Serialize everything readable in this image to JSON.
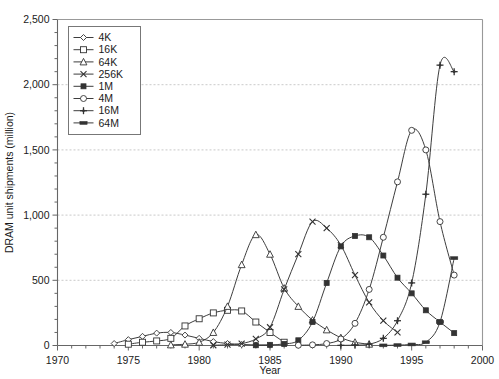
{
  "chart_data": {
    "type": "line",
    "title": "",
    "xlabel": "Year",
    "ylabel": "DRAM unit shipments (million)",
    "xlim": [
      1970,
      2000
    ],
    "ylim": [
      0,
      2500
    ],
    "xticks": [
      1970,
      1975,
      1980,
      1985,
      1990,
      1995,
      2000
    ],
    "xtick_labels": [
      "1970",
      "1975",
      "1980",
      "1985",
      "1990",
      "1995",
      "2000"
    ],
    "yticks": [
      0,
      500,
      1000,
      1500,
      2000,
      2500
    ],
    "ytick_labels": [
      "0",
      "500",
      "1,000",
      "1,500",
      "2,000",
      "2,500"
    ],
    "x_minor_step": 1,
    "y_minor_step": 100,
    "grid": "horizontal-major-dashed",
    "legend_position": "top-left-inside",
    "line_color": "#333333",
    "grid_color": "#bbbbbb",
    "axis_color": "#555555",
    "series": [
      {
        "name": "4K",
        "marker": "diamond-open",
        "x": [
          1974,
          1975,
          1976,
          1977,
          1978,
          1979,
          1980,
          1981,
          1982,
          1983,
          1984,
          1985
        ],
        "values": [
          15,
          45,
          70,
          95,
          100,
          80,
          55,
          30,
          15,
          8,
          4,
          2
        ]
      },
      {
        "name": "16K",
        "marker": "square-open",
        "x": [
          1975,
          1976,
          1977,
          1978,
          1979,
          1980,
          1981,
          1982,
          1983,
          1984,
          1985,
          1986
        ],
        "values": [
          10,
          25,
          35,
          55,
          150,
          205,
          250,
          270,
          265,
          180,
          100,
          25
        ]
      },
      {
        "name": "64K",
        "marker": "triangle-open",
        "x": [
          1978,
          1979,
          1980,
          1981,
          1982,
          1983,
          1984,
          1985,
          1986,
          1987,
          1988,
          1989,
          1990,
          1991,
          1992
        ],
        "values": [
          5,
          10,
          25,
          100,
          300,
          620,
          850,
          700,
          440,
          300,
          195,
          120,
          60,
          25,
          10
        ]
      },
      {
        "name": "256K",
        "marker": "x",
        "x": [
          1981,
          1982,
          1983,
          1984,
          1985,
          1986,
          1987,
          1988,
          1989,
          1990,
          1991,
          1992,
          1993,
          1994
        ],
        "values": [
          2,
          6,
          15,
          50,
          140,
          430,
          700,
          950,
          900,
          770,
          540,
          330,
          190,
          100
        ]
      },
      {
        "name": "1M",
        "marker": "square-filled",
        "x": [
          1984,
          1985,
          1986,
          1987,
          1988,
          1989,
          1990,
          1991,
          1992,
          1993,
          1994,
          1995,
          1996,
          1997,
          1998
        ],
        "values": [
          2,
          5,
          12,
          40,
          180,
          480,
          760,
          840,
          830,
          690,
          520,
          400,
          270,
          180,
          95
        ]
      },
      {
        "name": "4M",
        "marker": "circle-open",
        "x": [
          1987,
          1988,
          1989,
          1990,
          1991,
          1992,
          1993,
          1994,
          1995,
          1996,
          1997,
          1998
        ],
        "values": [
          2,
          5,
          15,
          50,
          170,
          430,
          830,
          1255,
          1650,
          1500,
          950,
          540
        ]
      },
      {
        "name": "16M",
        "marker": "plus-filled",
        "x": [
          1990,
          1991,
          1992,
          1993,
          1994,
          1995,
          1996,
          1997,
          1998
        ],
        "values": [
          1,
          3,
          10,
          55,
          190,
          480,
          1160,
          2150,
          2100
        ]
      },
      {
        "name": "64M",
        "marker": "bar-filled",
        "x": [
          1993,
          1994,
          1995,
          1996,
          1997,
          1998
        ],
        "values": [
          1,
          3,
          8,
          25,
          180,
          670
        ]
      }
    ]
  },
  "legend": {
    "entries": [
      "4K",
      "16K",
      "64K",
      "256K",
      "1M",
      "4M",
      "16M",
      "64M"
    ]
  }
}
